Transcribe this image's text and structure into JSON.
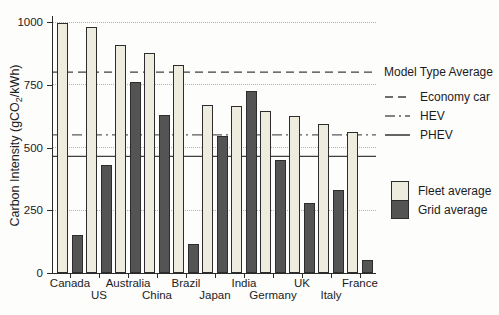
{
  "figure": {
    "ylabel_pre": "Carbon Intensity (gCO",
    "ylabel_sub": "2",
    "ylabel_post": "/kWh)"
  },
  "chart_data": {
    "type": "bar",
    "title": "",
    "xlabel": "",
    "ylabel": "Carbon Intensity (gCO2/kWh)",
    "ylim": [
      0,
      1000
    ],
    "yticks": [
      0,
      250,
      500,
      750,
      1000
    ],
    "grid": "horizontal dotted gridlines at 250, 500, 750, 1000",
    "legend_position": "right",
    "categories": [
      "Canada",
      "US",
      "Australia",
      "China",
      "Brazil",
      "Japan",
      "India",
      "Germany",
      "UK",
      "Italy",
      "France"
    ],
    "series": [
      {
        "name": "Fleet average",
        "color": "#edecdf",
        "values": [
          995,
          980,
          910,
          875,
          830,
          670,
          665,
          645,
          625,
          595,
          560
        ]
      },
      {
        "name": "Grid average",
        "color": "#545454",
        "values": [
          150,
          430,
          760,
          630,
          115,
          545,
          725,
          450,
          280,
          330,
          50
        ]
      }
    ],
    "reference_lines": [
      {
        "label": "Economy car",
        "value": 800,
        "style": "dashed",
        "color": "#3f3f3f"
      },
      {
        "label": "HEV",
        "value": 550,
        "style": "dashdot",
        "color": "#5a5a5a"
      },
      {
        "label": "PHEV",
        "value": 465,
        "style": "solid",
        "color": "#3f3f3f"
      }
    ],
    "legends": {
      "model_type_title": "Model Type Average",
      "series_labels": [
        "Fleet average",
        "Grid average"
      ]
    }
  }
}
